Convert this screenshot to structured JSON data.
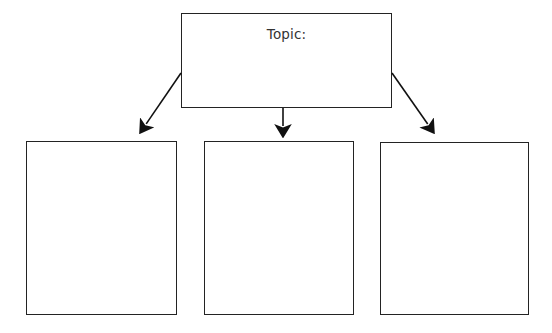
{
  "page": {
    "background_color": "#ffffff",
    "line_color": "#232323",
    "text_color": "#333333",
    "width": 552,
    "height": 333
  },
  "diagram": {
    "type": "graphic-organizer",
    "title_box": {
      "label": "Topic:",
      "x": 181,
      "y": 13,
      "width": 211,
      "height": 95,
      "content": ""
    },
    "detail_boxes": [
      {
        "label": "",
        "x": 26,
        "y": 141,
        "width": 151,
        "height": 174
      },
      {
        "label": "",
        "x": 204,
        "y": 141,
        "width": 150,
        "height": 174
      },
      {
        "label": "",
        "x": 380,
        "y": 142,
        "width": 149,
        "height": 173
      }
    ],
    "arrows": [
      {
        "name": "arrow-left",
        "from": [
          181,
          73
        ],
        "to": [
          140,
          133
        ]
      },
      {
        "name": "arrow-center",
        "from": [
          283,
          108
        ],
        "to": [
          283,
          137
        ]
      },
      {
        "name": "arrow-right",
        "from": [
          392,
          73
        ],
        "to": [
          434,
          133
        ]
      }
    ]
  }
}
